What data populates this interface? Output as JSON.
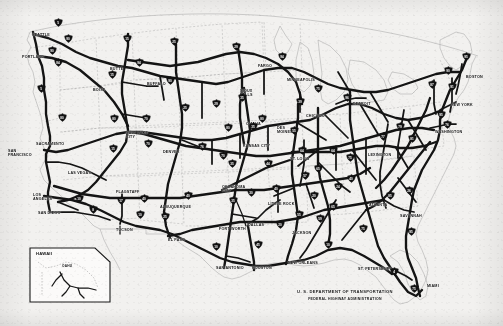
{
  "document": {
    "type": "map",
    "title": "Dwight D. Eisenhower National System of Interstate and Defense Highways",
    "agency_line1": "U. S. DEPARTMENT OF TRANSPORTATION",
    "agency_line2": "FEDERAL HIGHWAY ADMINISTRATION"
  },
  "colors": {
    "background": "#f2f1ef",
    "route_line": "#121212",
    "state_border": "#9a9a9a",
    "coastline": "#3a3a3a",
    "shield_fill": "#121212",
    "shield_text": "#ffffff",
    "label_text": "#111111"
  },
  "inset": {
    "name": "HAWAII",
    "island_label": "OAHU",
    "routes": [
      "H1",
      "H2",
      "H3"
    ]
  },
  "cities": [
    {
      "name": "SEATTLE",
      "x": 32,
      "y": 34
    },
    {
      "name": "PORTLAND",
      "x": 22,
      "y": 56
    },
    {
      "name": "SACRAMENTO",
      "x": 36,
      "y": 143
    },
    {
      "name": "SAN\nFRANCISCO",
      "x": 8,
      "y": 150
    },
    {
      "name": "LOS\nANGELES",
      "x": 33,
      "y": 194
    },
    {
      "name": "SAN DIEGO",
      "x": 38,
      "y": 212
    },
    {
      "name": "LAS VEGAS",
      "x": 68,
      "y": 172
    },
    {
      "name": "FLAGSTAFF",
      "x": 116,
      "y": 191
    },
    {
      "name": "TUCSON",
      "x": 116,
      "y": 229
    },
    {
      "name": "BOISE",
      "x": 93,
      "y": 89
    },
    {
      "name": "BUTTE",
      "x": 110,
      "y": 68
    },
    {
      "name": "BUFFALO",
      "x": 147,
      "y": 83
    },
    {
      "name": "SALT LAKE\nCITY",
      "x": 126,
      "y": 132
    },
    {
      "name": "DENVER",
      "x": 163,
      "y": 151
    },
    {
      "name": "ALBUQUERQUE",
      "x": 160,
      "y": 206
    },
    {
      "name": "EL PASO",
      "x": 168,
      "y": 239
    },
    {
      "name": "FARGO",
      "x": 258,
      "y": 65
    },
    {
      "name": "SIOUX\nFALLS",
      "x": 240,
      "y": 90
    },
    {
      "name": "MINNEAPOLIS",
      "x": 287,
      "y": 79
    },
    {
      "name": "OMAHA",
      "x": 246,
      "y": 123
    },
    {
      "name": "DES\nMOINES",
      "x": 277,
      "y": 127
    },
    {
      "name": "KANSAS CITY",
      "x": 243,
      "y": 145
    },
    {
      "name": "ST. LOUIS",
      "x": 290,
      "y": 158
    },
    {
      "name": "CHICAGO",
      "x": 306,
      "y": 115
    },
    {
      "name": "DETROIT",
      "x": 353,
      "y": 103
    },
    {
      "name": "OKLAHOMA\nCITY",
      "x": 222,
      "y": 186
    },
    {
      "name": "FORT WORTH",
      "x": 219,
      "y": 228
    },
    {
      "name": "DALLAS",
      "x": 248,
      "y": 224
    },
    {
      "name": "LITTLE ROCK",
      "x": 268,
      "y": 203
    },
    {
      "name": "JACKSON",
      "x": 292,
      "y": 232
    },
    {
      "name": "SAN ANTONIO",
      "x": 216,
      "y": 267
    },
    {
      "name": "HOUSTON",
      "x": 252,
      "y": 267
    },
    {
      "name": "NEW ORLEANS",
      "x": 288,
      "y": 262
    },
    {
      "name": "ST. PETERSBURG",
      "x": 358,
      "y": 268
    },
    {
      "name": "MIAMI",
      "x": 427,
      "y": 285
    },
    {
      "name": "ATLANTA",
      "x": 369,
      "y": 204
    },
    {
      "name": "SAVANNAH",
      "x": 400,
      "y": 215
    },
    {
      "name": "LEXINGTON",
      "x": 368,
      "y": 154
    },
    {
      "name": "WASHINGTON",
      "x": 435,
      "y": 131
    },
    {
      "name": "NEW YORK",
      "x": 451,
      "y": 104
    },
    {
      "name": "BOSTON",
      "x": 466,
      "y": 76
    }
  ],
  "shields": [
    {
      "route": "5",
      "x": 58,
      "y": 22
    },
    {
      "route": "90",
      "x": 68,
      "y": 38
    },
    {
      "route": "90",
      "x": 52,
      "y": 50
    },
    {
      "route": "84",
      "x": 58,
      "y": 62
    },
    {
      "route": "15",
      "x": 127,
      "y": 38
    },
    {
      "route": "94",
      "x": 139,
      "y": 62
    },
    {
      "route": "25",
      "x": 174,
      "y": 41
    },
    {
      "route": "29",
      "x": 236,
      "y": 46
    },
    {
      "route": "94",
      "x": 282,
      "y": 56
    },
    {
      "route": "5",
      "x": 41,
      "y": 88
    },
    {
      "route": "80",
      "x": 62,
      "y": 117
    },
    {
      "route": "15",
      "x": 112,
      "y": 74
    },
    {
      "route": "90",
      "x": 170,
      "y": 80
    },
    {
      "route": "25",
      "x": 185,
      "y": 107
    },
    {
      "route": "80",
      "x": 114,
      "y": 118
    },
    {
      "route": "70",
      "x": 146,
      "y": 118
    },
    {
      "route": "15",
      "x": 113,
      "y": 148
    },
    {
      "route": "70",
      "x": 148,
      "y": 143
    },
    {
      "route": "76",
      "x": 202,
      "y": 146
    },
    {
      "route": "80",
      "x": 228,
      "y": 127
    },
    {
      "route": "29",
      "x": 216,
      "y": 103
    },
    {
      "route": "35",
      "x": 242,
      "y": 97
    },
    {
      "route": "35",
      "x": 253,
      "y": 126
    },
    {
      "route": "80",
      "x": 262,
      "y": 118
    },
    {
      "route": "55",
      "x": 294,
      "y": 130
    },
    {
      "route": "39",
      "x": 300,
      "y": 101
    },
    {
      "route": "75",
      "x": 318,
      "y": 88
    },
    {
      "route": "96",
      "x": 347,
      "y": 97
    },
    {
      "route": "70",
      "x": 223,
      "y": 155
    },
    {
      "route": "35",
      "x": 232,
      "y": 163
    },
    {
      "route": "44",
      "x": 268,
      "y": 163
    },
    {
      "route": "64",
      "x": 302,
      "y": 150
    },
    {
      "route": "64",
      "x": 333,
      "y": 150
    },
    {
      "route": "75",
      "x": 350,
      "y": 157
    },
    {
      "route": "77",
      "x": 383,
      "y": 136
    },
    {
      "route": "79",
      "x": 400,
      "y": 126
    },
    {
      "route": "81",
      "x": 412,
      "y": 138
    },
    {
      "route": "95",
      "x": 441,
      "y": 114
    },
    {
      "route": "87",
      "x": 432,
      "y": 84
    },
    {
      "route": "90",
      "x": 448,
      "y": 70
    },
    {
      "route": "91",
      "x": 452,
      "y": 86
    },
    {
      "route": "95",
      "x": 466,
      "y": 56
    },
    {
      "route": "76",
      "x": 447,
      "y": 124
    },
    {
      "route": "40",
      "x": 144,
      "y": 198
    },
    {
      "route": "10",
      "x": 140,
      "y": 214
    },
    {
      "route": "17",
      "x": 121,
      "y": 200
    },
    {
      "route": "8",
      "x": 93,
      "y": 209
    },
    {
      "route": "10",
      "x": 79,
      "y": 198
    },
    {
      "route": "40",
      "x": 188,
      "y": 195
    },
    {
      "route": "25",
      "x": 165,
      "y": 216
    },
    {
      "route": "10",
      "x": 216,
      "y": 246
    },
    {
      "route": "35",
      "x": 233,
      "y": 200
    },
    {
      "route": "45",
      "x": 258,
      "y": 244
    },
    {
      "route": "20",
      "x": 280,
      "y": 224
    },
    {
      "route": "55",
      "x": 299,
      "y": 214
    },
    {
      "route": "65",
      "x": 333,
      "y": 206
    },
    {
      "route": "75",
      "x": 363,
      "y": 228
    },
    {
      "route": "85",
      "x": 390,
      "y": 195
    },
    {
      "route": "95",
      "x": 411,
      "y": 231
    },
    {
      "route": "10",
      "x": 328,
      "y": 244
    },
    {
      "route": "4",
      "x": 394,
      "y": 271
    },
    {
      "route": "75",
      "x": 414,
      "y": 288
    },
    {
      "route": "20",
      "x": 314,
      "y": 195
    },
    {
      "route": "59",
      "x": 320,
      "y": 218
    },
    {
      "route": "26",
      "x": 409,
      "y": 190
    },
    {
      "route": "40",
      "x": 351,
      "y": 178
    },
    {
      "route": "24",
      "x": 338,
      "y": 186
    },
    {
      "route": "65",
      "x": 318,
      "y": 168
    },
    {
      "route": "57",
      "x": 305,
      "y": 175
    },
    {
      "route": "30",
      "x": 251,
      "y": 192
    },
    {
      "route": "40",
      "x": 276,
      "y": 188
    }
  ]
}
